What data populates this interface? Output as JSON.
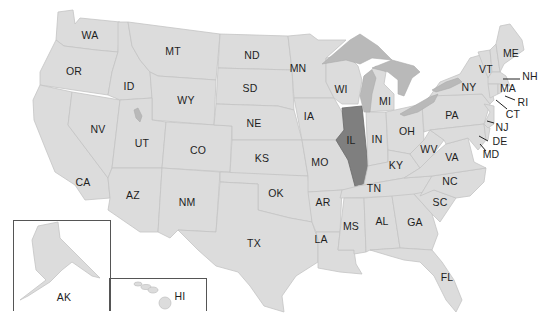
{
  "map": {
    "title": "United States map",
    "highlighted_state": "IL",
    "colors": {
      "state_fill": "#dcdcdc",
      "highlight_fill": "#7f7f7f",
      "lake_fill": "#b9b9b9",
      "border": "#c4c4c4",
      "background": "#ffffff"
    },
    "labels": {
      "WA": "WA",
      "OR": "OR",
      "CA": "CA",
      "ID": "ID",
      "NV": "NV",
      "MT": "MT",
      "WY": "WY",
      "UT": "UT",
      "AZ": "AZ",
      "CO": "CO",
      "NM": "NM",
      "ND": "ND",
      "SD": "SD",
      "NE": "NE",
      "KS": "KS",
      "OK": "OK",
      "TX": "TX",
      "MN": "MN",
      "IA": "IA",
      "MO": "MO",
      "AR": "AR",
      "LA": "LA",
      "WI": "WI",
      "IL": "IL",
      "MI": "MI",
      "IN": "IN",
      "OH": "OH",
      "KY": "KY",
      "TN": "TN",
      "MS": "MS",
      "AL": "AL",
      "GA": "GA",
      "FL": "FL",
      "SC": "SC",
      "NC": "NC",
      "VA": "VA",
      "WV": "WV",
      "PA": "PA",
      "NY": "NY",
      "VT": "VT",
      "ME": "ME",
      "NH": "NH",
      "MA": "MA",
      "RI": "RI",
      "CT": "CT",
      "NJ": "NJ",
      "DE": "DE",
      "MD": "MD",
      "AK": "AK",
      "HI": "HI"
    }
  }
}
